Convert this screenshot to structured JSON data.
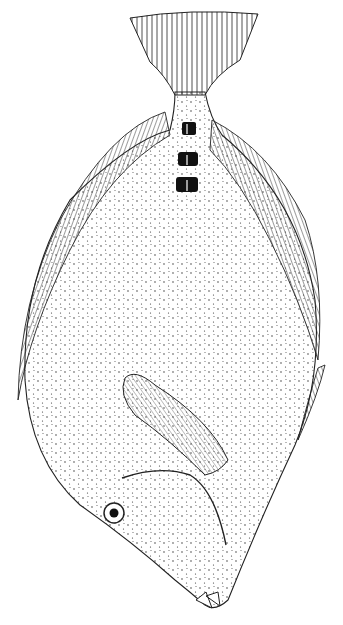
{
  "image": {
    "subject": "flatfish stipple illustration",
    "style": "black ink stipple on white",
    "background_color": "#ffffff",
    "ink_color": "#111111"
  },
  "features": {
    "caudal_fin": "fan-shaped tail with radiating rays at top",
    "peduncle_spots": 3,
    "dorsal_fin": "ray-hatched fin along left edge",
    "anal_fin": "ray-hatched fin along right edge",
    "pectoral_fin": "striated elongated fin mid-lower body",
    "pelvic_fin": "small narrow fin on right lower edge",
    "eye": "single ringed eye lower left",
    "mouth": "small protruding jaws at bottom"
  }
}
